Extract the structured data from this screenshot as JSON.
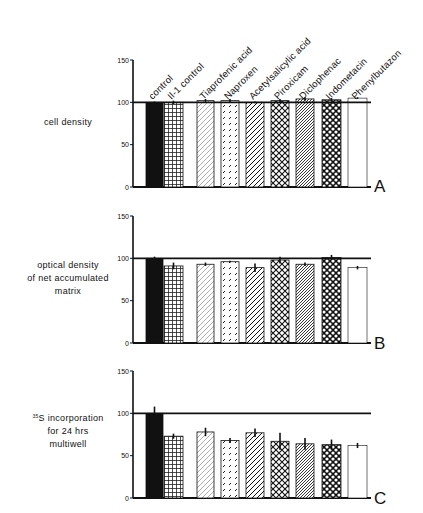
{
  "chart_data": [
    {
      "type": "bar",
      "panel": "A",
      "ylabel": "cell density",
      "ylim": [
        0,
        150
      ],
      "yticks": [
        0,
        50,
        100,
        150
      ],
      "reference_line": 100,
      "categories": [
        "control",
        "Il-1 control",
        "Tiaprofenic acid",
        "Naproxen",
        "Acetylsalicylic acid",
        "Piroxicam",
        "Diclophenac",
        "Indometacin",
        "Phenylbutazon"
      ],
      "values": [
        100,
        100,
        102,
        102,
        100,
        102,
        104,
        103,
        105
      ],
      "errors": [
        1,
        2,
        2,
        2,
        1,
        2,
        2,
        2,
        1
      ]
    },
    {
      "type": "bar",
      "panel": "B",
      "ylabel": "optical density of net accumulated matrix",
      "ylim": [
        0,
        150
      ],
      "yticks": [
        0,
        50,
        100,
        150
      ],
      "reference_line": 100,
      "categories": [
        "control",
        "Il-1 control",
        "Tiaprofenic acid",
        "Naproxen",
        "Acetylsalicylic acid",
        "Piroxicam",
        "Diclophenac",
        "Indometacin",
        "Phenylbutazon"
      ],
      "values": [
        100,
        91,
        93,
        96,
        89,
        98,
        93,
        101,
        89
      ],
      "errors": [
        2,
        4,
        2,
        1,
        5,
        4,
        2,
        3,
        2
      ]
    },
    {
      "type": "bar",
      "panel": "C",
      "ylabel": "35S incorporation for 24 hrs multiwell",
      "ylim": [
        0,
        150
      ],
      "yticks": [
        0,
        50,
        100,
        150
      ],
      "reference_line": 100,
      "categories": [
        "control",
        "Il-1 control",
        "Tiaprofenic acid",
        "Naproxen",
        "Acetylsalicylic acid",
        "Piroxicam",
        "Diclophenac",
        "Indometacin",
        "Phenylbutazon"
      ],
      "values": [
        100,
        73,
        78,
        68,
        77,
        67,
        64,
        63,
        62
      ],
      "errors": [
        8,
        3,
        5,
        3,
        5,
        10,
        7,
        6,
        3
      ]
    }
  ],
  "labels": {
    "categories": [
      "control",
      "Il-1 control",
      "Tiaprofenic acid",
      "Naproxen",
      "Acetylsalicylic acid",
      "Piroxicam",
      "Diclophenac",
      "Indometacin",
      "Phenylbutazon"
    ],
    "panel_a_letter": "A",
    "panel_b_letter": "B",
    "panel_c_letter": "C",
    "panel_a_ylabel": [
      "cell density"
    ],
    "panel_b_ylabel": [
      "optical density",
      "of net accumulated",
      "matrix"
    ],
    "panel_c_ylabel_sup": "35",
    "panel_c_ylabel": [
      "S incorporation",
      "for 24 hrs",
      "multiwell"
    ],
    "yticks": [
      "0",
      "50",
      "100",
      "150"
    ]
  }
}
